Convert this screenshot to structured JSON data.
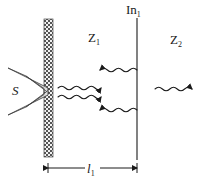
{
  "figure": {
    "type": "physics-schematic",
    "width": 208,
    "height": 184,
    "background_color": "#ffffff",
    "ink_color": "#1a1a1a"
  },
  "labels": {
    "source": {
      "text": "S",
      "italic": true,
      "x": 12,
      "y": 95
    },
    "zone_1": {
      "base": "Z",
      "subscript": "1",
      "x": 88,
      "y": 42
    },
    "zone_2": {
      "base": "Z",
      "subscript": "2",
      "x": 170,
      "y": 44
    },
    "interface": {
      "base": "In",
      "subscript": "1",
      "x": 126,
      "y": 14
    },
    "distance": {
      "base": "l",
      "subscript": "1",
      "italic": true,
      "x": 88,
      "y": 173
    }
  },
  "barrier": {
    "name": "hatched-wall",
    "x": 44,
    "y": 19,
    "width": 9,
    "height": 138,
    "pattern": "stippled-checker"
  },
  "interface_line": {
    "name": "interface-plane-In1",
    "x": 137,
    "y_top": 18,
    "y_bottom": 160
  },
  "source_horn": {
    "name": "source-wedge",
    "points_outer": "8,68 48,88 48,97 8,115",
    "points_inner": "26,76 43,88 43,97 26,107"
  },
  "waves": [
    {
      "name": "wave-z1-top",
      "x_start": 137,
      "x_end": 100,
      "y": 70,
      "direction": "left",
      "cycles": 5
    },
    {
      "name": "wave-z1-upper-mid",
      "x_start": 58,
      "x_end": 101,
      "y": 88,
      "direction": "right",
      "cycles": 5
    },
    {
      "name": "wave-z1-lower-mid",
      "x_start": 58,
      "x_end": 101,
      "y": 97,
      "direction": "right",
      "cycles": 5
    },
    {
      "name": "wave-z1-bottom",
      "x_start": 137,
      "x_end": 100,
      "y": 110,
      "direction": "left",
      "cycles": 5
    },
    {
      "name": "wave-z2",
      "x_start": 155,
      "x_end": 198,
      "y": 89,
      "direction": "right",
      "cycles": 5
    }
  ],
  "dimension": {
    "name": "length-l1",
    "y": 168,
    "x_left": 48,
    "x_right": 137,
    "tick_half_height": 5
  }
}
